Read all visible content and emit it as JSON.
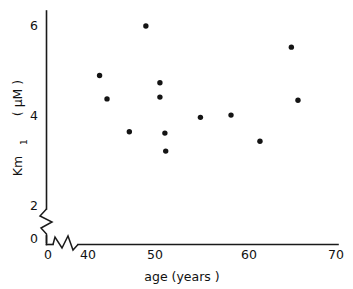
{
  "chart_data": {
    "type": "scatter",
    "title": "",
    "xlabel": "age   (years )",
    "ylabel": "Km1  ( µM )",
    "ylabel_main": "Km",
    "ylabel_sub": "1",
    "ylabel_units": "( µM )",
    "xlim": [
      0,
      70
    ],
    "ylim": [
      0,
      6.4
    ],
    "grid": false,
    "legend": null,
    "x_ticks": [
      {
        "value": 0,
        "label": "0"
      },
      {
        "value": 40,
        "label": "40"
      },
      {
        "value": 50,
        "label": "50"
      },
      {
        "value": 60,
        "label": "60"
      },
      {
        "value": 70,
        "label": "70"
      }
    ],
    "y_ticks": [
      {
        "value": 0,
        "label": "0"
      },
      {
        "value": 2,
        "label": "2"
      },
      {
        "value": 4,
        "label": "4"
      },
      {
        "value": 6,
        "label": "6"
      }
    ],
    "axis_break_x": true,
    "axis_break_y": true,
    "marker": "filled-circle",
    "marker_color": "#141414",
    "points": [
      {
        "x": 41.4,
        "y": 4.9
      },
      {
        "x": 42.3,
        "y": 4.38
      },
      {
        "x": 47.0,
        "y": 6.0
      },
      {
        "x": 45.0,
        "y": 3.65
      },
      {
        "x": 48.7,
        "y": 4.74
      },
      {
        "x": 48.7,
        "y": 4.42
      },
      {
        "x": 49.3,
        "y": 3.62
      },
      {
        "x": 49.4,
        "y": 3.22
      },
      {
        "x": 53.6,
        "y": 3.97
      },
      {
        "x": 57.3,
        "y": 4.02
      },
      {
        "x": 60.8,
        "y": 3.44
      },
      {
        "x": 64.6,
        "y": 5.53
      },
      {
        "x": 65.4,
        "y": 4.35
      }
    ]
  },
  "axis_labels": {
    "x_axis_caption": "age   (years )",
    "y_axis_caption_main": "Km",
    "y_axis_caption_sub": "1",
    "y_axis_caption_units": "( µM )"
  },
  "tick_labels": {
    "x": [
      "0",
      "40",
      "50",
      "60",
      "70"
    ],
    "y": [
      "0",
      "2",
      "4",
      "6"
    ]
  }
}
